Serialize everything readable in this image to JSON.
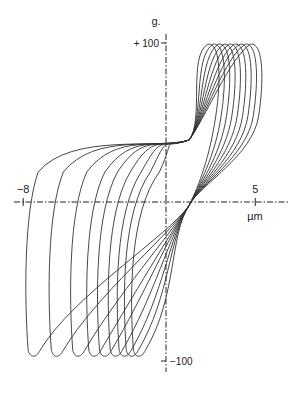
{
  "chart_data": {
    "type": "line",
    "title": "",
    "xlabel": "µm",
    "ylabel": "g.",
    "x_ticks": [
      {
        "value": -8,
        "label": "−8"
      },
      {
        "value": 5,
        "label": "5"
      }
    ],
    "y_ticks": [
      {
        "value": 100,
        "label": "+ 100"
      },
      {
        "value": -100,
        "label": "−100"
      }
    ],
    "xlim": [
      -9,
      6.5
    ],
    "ylim": [
      -120,
      125
    ],
    "grid": false,
    "legend": "none",
    "series": [
      {
        "name": "loop-1",
        "x_min": -7.5,
        "y_min": -97,
        "x_max": 5.3,
        "y_max": 98
      },
      {
        "name": "loop-2",
        "x_min": -6.2,
        "y_min": -97,
        "x_max": 5.0,
        "y_max": 98
      },
      {
        "name": "loop-3",
        "x_min": -5.0,
        "y_min": -97,
        "x_max": 4.7,
        "y_max": 98
      },
      {
        "name": "loop-4",
        "x_min": -4.1,
        "y_min": -97,
        "x_max": 4.4,
        "y_max": 98
      },
      {
        "name": "loop-5",
        "x_min": -3.5,
        "y_min": -97,
        "x_max": 4.1,
        "y_max": 98
      },
      {
        "name": "loop-6",
        "x_min": -2.9,
        "y_min": -97,
        "x_max": 3.8,
        "y_max": 98
      },
      {
        "name": "loop-7",
        "x_min": -2.4,
        "y_min": -97,
        "x_max": 3.5,
        "y_max": 98
      },
      {
        "name": "loop-8",
        "x_min": -2.0,
        "y_min": -97,
        "x_max": 3.2,
        "y_max": 98
      },
      {
        "name": "loop-9",
        "x_min": -1.6,
        "y_min": -97,
        "x_max": 2.9,
        "y_max": 98
      }
    ],
    "crossing_points": [
      {
        "x": 1.3,
        "y": 39
      },
      {
        "x": 1.3,
        "y": -2
      }
    ]
  }
}
